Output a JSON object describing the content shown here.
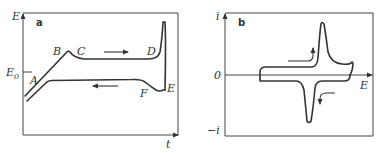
{
  "panels": [
    {
      "id": "a",
      "panel_label": "a",
      "y_axis_label": "E",
      "x_axis_label": "t",
      "reference_level_label": "E0",
      "reference_level_main": "E",
      "reference_level_sub": "0",
      "points": {
        "A": "A",
        "B": "B",
        "C": "C",
        "D": "D",
        "E": "E",
        "F": "F"
      },
      "arrows": [
        "forward-right",
        "reverse-left"
      ]
    },
    {
      "id": "b",
      "panel_label": "b",
      "y_axis_label": "i",
      "y_axis_zero": "0",
      "y_axis_negative": "−i",
      "x_axis_label": "E",
      "arrows": [
        "anodic-up",
        "cathodic-down"
      ]
    }
  ],
  "colors": {
    "line": "#333333",
    "frame": "#444444",
    "background": "#ffffff"
  }
}
